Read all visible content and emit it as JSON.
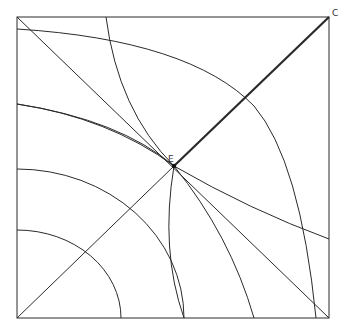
{
  "diagram": {
    "type": "geometric-construction",
    "labels": {
      "C": "C",
      "E": "E"
    },
    "colors": {
      "background": "#ffffff",
      "stroke": "#2a2a2a",
      "label": "#333333"
    },
    "square": {
      "x1": 17,
      "y1": 17,
      "x2": 329,
      "y2": 318
    },
    "points": {
      "A_bottom_left": [
        17,
        318
      ],
      "C_top_right": [
        329,
        17
      ],
      "E_center": [
        174,
        166
      ]
    }
  }
}
